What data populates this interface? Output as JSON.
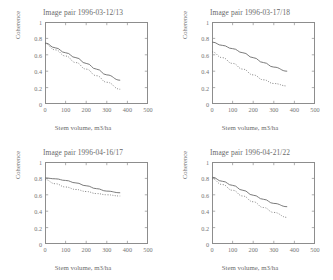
{
  "figure": {
    "xlabel": "Stem volume, m3/ha",
    "ylabel": "Coherence",
    "xticks": [
      "0",
      "100",
      "200",
      "300",
      "400",
      "500"
    ],
    "yticks": [
      "0",
      "0.2",
      "0.4",
      "0.6",
      "0.8",
      "1"
    ],
    "line_color": "#6b6b6b"
  },
  "chart_data": [
    {
      "type": "line",
      "title": "Image pair 1996-03-12/13",
      "xlabel": "Stem volume, m3/ha",
      "ylabel": "Coherence",
      "xlim": [
        0,
        500
      ],
      "ylim": [
        0,
        1
      ],
      "xticks": [
        0,
        100,
        200,
        300,
        400,
        500
      ],
      "yticks": [
        0,
        0.2,
        0.4,
        0.6,
        0.8,
        1
      ],
      "grid": false,
      "legend": null,
      "series": [
        {
          "name": "solid",
          "style": "solid",
          "x": [
            0,
            50,
            100,
            150,
            200,
            250,
            300,
            365
          ],
          "values": [
            0.745,
            0.685,
            0.625,
            0.565,
            0.495,
            0.425,
            0.355,
            0.29
          ]
        },
        {
          "name": "dotted",
          "style": "dotted",
          "x": [
            0,
            50,
            100,
            150,
            200,
            250,
            300,
            365
          ],
          "values": [
            0.735,
            0.66,
            0.585,
            0.505,
            0.425,
            0.345,
            0.265,
            0.18
          ]
        }
      ]
    },
    {
      "type": "line",
      "title": "Image pair 1996-03-17/18",
      "xlabel": "Stem volume, m3/ha",
      "ylabel": "Coherence",
      "xlim": [
        0,
        500
      ],
      "ylim": [
        0,
        1
      ],
      "xticks": [
        0,
        100,
        200,
        300,
        400,
        500
      ],
      "yticks": [
        0,
        0.2,
        0.4,
        0.6,
        0.8,
        1
      ],
      "grid": false,
      "legend": null,
      "series": [
        {
          "name": "solid",
          "style": "solid",
          "x": [
            0,
            50,
            100,
            150,
            200,
            250,
            300,
            365
          ],
          "values": [
            0.755,
            0.715,
            0.675,
            0.625,
            0.565,
            0.505,
            0.45,
            0.4
          ]
        },
        {
          "name": "dotted",
          "style": "dotted",
          "x": [
            0,
            50,
            100,
            150,
            200,
            250,
            300,
            365
          ],
          "values": [
            0.635,
            0.565,
            0.495,
            0.425,
            0.355,
            0.295,
            0.25,
            0.22
          ]
        }
      ]
    },
    {
      "type": "line",
      "title": "Image pair 1996-04-16/17",
      "xlabel": "Stem volume, m3/ha",
      "ylabel": "Coherence",
      "xlim": [
        0,
        500
      ],
      "ylim": [
        0,
        1
      ],
      "xticks": [
        0,
        100,
        200,
        300,
        400,
        500
      ],
      "yticks": [
        0,
        0.2,
        0.4,
        0.6,
        0.8,
        1
      ],
      "grid": false,
      "legend": null,
      "series": [
        {
          "name": "solid",
          "style": "solid",
          "x": [
            0,
            50,
            100,
            150,
            200,
            250,
            300,
            365
          ],
          "values": [
            0.805,
            0.795,
            0.775,
            0.745,
            0.71,
            0.675,
            0.645,
            0.625
          ]
        },
        {
          "name": "dotted",
          "style": "dotted",
          "x": [
            0,
            50,
            100,
            150,
            200,
            250,
            300,
            365
          ],
          "values": [
            0.785,
            0.735,
            0.695,
            0.665,
            0.64,
            0.615,
            0.6,
            0.585
          ]
        }
      ]
    },
    {
      "type": "line",
      "title": "Image pair 1996-04-21/22",
      "xlabel": "Stem volume, m3/ha",
      "ylabel": "Coherence",
      "xlim": [
        0,
        500
      ],
      "ylim": [
        0,
        1
      ],
      "xticks": [
        0,
        100,
        200,
        300,
        400,
        500
      ],
      "yticks": [
        0,
        0.2,
        0.4,
        0.6,
        0.8,
        1
      ],
      "grid": false,
      "legend": null,
      "series": [
        {
          "name": "solid",
          "style": "solid",
          "x": [
            0,
            50,
            100,
            150,
            200,
            250,
            300,
            365
          ],
          "values": [
            0.815,
            0.765,
            0.715,
            0.655,
            0.595,
            0.545,
            0.495,
            0.455
          ]
        },
        {
          "name": "dotted",
          "style": "dotted",
          "x": [
            0,
            50,
            100,
            150,
            200,
            250,
            300,
            365
          ],
          "values": [
            0.795,
            0.725,
            0.655,
            0.585,
            0.515,
            0.445,
            0.385,
            0.325
          ]
        }
      ]
    }
  ]
}
